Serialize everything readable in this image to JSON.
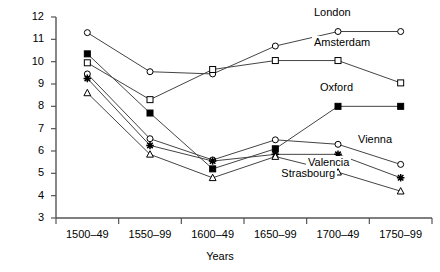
{
  "chart_data": {
    "type": "line",
    "title": "",
    "xlabel": "Years",
    "ylabel": "",
    "categories": [
      "1500–49",
      "1550–99",
      "1600–49",
      "1650–99",
      "1700–49",
      "1750–99"
    ],
    "ylim": [
      3,
      12
    ],
    "yticks": [
      3,
      4,
      5,
      6,
      7,
      8,
      9,
      10,
      11,
      12
    ],
    "grid": false,
    "legend_position": "inline-right-of-last-visible-point",
    "series": [
      {
        "name": "London",
        "marker": "open-circle",
        "values": [
          11.3,
          9.55,
          9.45,
          10.7,
          11.35,
          11.35
        ]
      },
      {
        "name": "Amsterdam",
        "marker": "open-square",
        "values": [
          9.95,
          8.3,
          9.65,
          10.05,
          10.05,
          9.05
        ]
      },
      {
        "name": "Oxford",
        "marker": "filled-square",
        "values": [
          10.35,
          7.7,
          5.2,
          6.1,
          8.0,
          8.0
        ]
      },
      {
        "name": "Vienna",
        "marker": "open-circle",
        "values": [
          9.45,
          6.55,
          5.6,
          6.5,
          6.3,
          5.4
        ]
      },
      {
        "name": "Valencia",
        "marker": "star",
        "values": [
          9.25,
          6.25,
          5.55,
          5.85,
          5.85,
          4.8
        ]
      },
      {
        "name": "Strasbourg",
        "marker": "open-triangle",
        "values": [
          8.6,
          5.85,
          4.8,
          5.75,
          5.05,
          4.2
        ]
      }
    ]
  },
  "axis": {
    "x_title": "Years"
  }
}
